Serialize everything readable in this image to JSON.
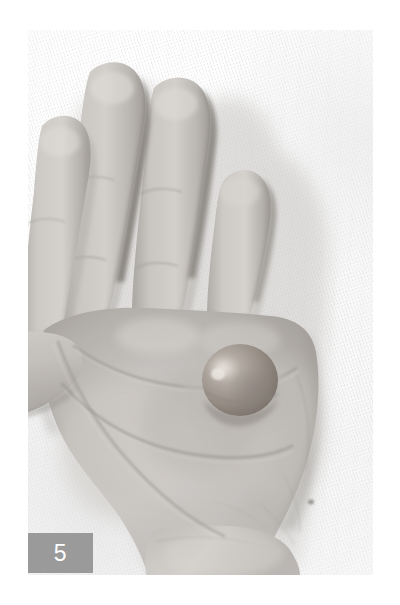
{
  "figure": {
    "number": "5",
    "caption_tag_color": "#9a9a9a",
    "caption_tag_text_color": "#ffffff"
  },
  "photo": {
    "subject": "open-right-palm-with-nodule",
    "orientation": "portrait",
    "background_description": "white-woven-cloth",
    "tone": "grayscale-desaturated",
    "colors": {
      "background_white": "#fbfbfb",
      "cloth_shadow": "#e8e8e8",
      "skin_light": "#d9d6d2",
      "skin_mid": "#b8b4b0",
      "skin_shadow": "#8e8a86",
      "crease_line": "#8a8682",
      "nodule_base": "#8e8278",
      "nodule_shadow": "#6d6359",
      "nodule_highlight": "#cfc8c0"
    },
    "features": [
      {
        "name": "index-finger",
        "label": "Index finger"
      },
      {
        "name": "middle-finger",
        "label": "Middle finger"
      },
      {
        "name": "ring-finger",
        "label": "Ring finger"
      },
      {
        "name": "little-finger",
        "label": "Little finger"
      },
      {
        "name": "thumb",
        "label": "Thumb"
      },
      {
        "name": "palm",
        "label": "Palm"
      },
      {
        "name": "nodule",
        "label": "Palmar nodule"
      },
      {
        "name": "wrist",
        "label": "Wrist"
      },
      {
        "name": "distal-palmar-crease",
        "label": "Distal palmar crease"
      },
      {
        "name": "proximal-palmar-crease",
        "label": "Proximal palmar crease"
      },
      {
        "name": "thenar-crease",
        "label": "Thenar crease"
      }
    ]
  }
}
